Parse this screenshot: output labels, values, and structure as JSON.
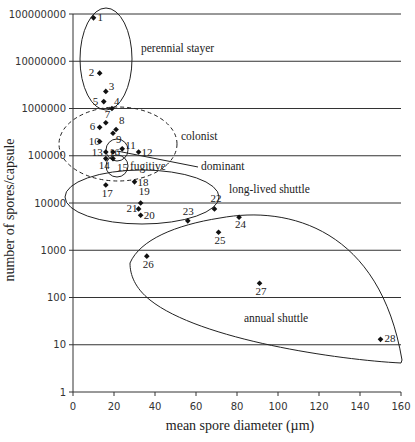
{
  "chart_data": {
    "type": "scatter",
    "title": "",
    "xlabel": "mean spore diameter (µm)",
    "ylabel": "number of spores/capsule",
    "xlim": [
      0,
      160
    ],
    "ylim": [
      1,
      100000000
    ],
    "yscale": "log",
    "grid": "horizontal",
    "x_ticks": [
      "0",
      "20",
      "40",
      "60",
      "80",
      "100",
      "120",
      "140",
      "160"
    ],
    "y_ticks": [
      "1",
      "10",
      "100",
      "1000",
      "10000",
      "100000",
      "1000000",
      "10000000",
      "100000000"
    ],
    "points": [
      {
        "id": "1",
        "x": 10,
        "y": 83000000
      },
      {
        "id": "2",
        "x": 13,
        "y": 5600000
      },
      {
        "id": "3",
        "x": 16,
        "y": 2300000
      },
      {
        "id": "4",
        "x": 19,
        "y": 1000000
      },
      {
        "id": "5",
        "x": 15,
        "y": 1400000
      },
      {
        "id": "6",
        "x": 13,
        "y": 400000
      },
      {
        "id": "7",
        "x": 16,
        "y": 500000
      },
      {
        "id": "8",
        "x": 21,
        "y": 360000
      },
      {
        "id": "9",
        "x": 19.5,
        "y": 300000
      },
      {
        "id": "10",
        "x": 13,
        "y": 200000
      },
      {
        "id": "11",
        "x": 24,
        "y": 140000
      },
      {
        "id": "12",
        "x": 32,
        "y": 120000
      },
      {
        "id": "13",
        "x": 16,
        "y": 120000
      },
      {
        "id": "14",
        "x": 16,
        "y": 87000
      },
      {
        "id": "15",
        "x": 19.5,
        "y": 87000
      },
      {
        "id": "16",
        "x": 19.5,
        "y": 120000
      },
      {
        "id": "17",
        "x": 16,
        "y": 24000
      },
      {
        "id": "18",
        "x": 30,
        "y": 28000
      },
      {
        "id": "19",
        "x": 33,
        "y": 10000
      },
      {
        "id": "20",
        "x": 33,
        "y": 5500
      },
      {
        "id": "21",
        "x": 32,
        "y": 7500
      },
      {
        "id": "22",
        "x": 69,
        "y": 7500
      },
      {
        "id": "23",
        "x": 56,
        "y": 4200
      },
      {
        "id": "24",
        "x": 81,
        "y": 5000
      },
      {
        "id": "25",
        "x": 71,
        "y": 2400
      },
      {
        "id": "26",
        "x": 36,
        "y": 750
      },
      {
        "id": "27",
        "x": 91,
        "y": 200
      },
      {
        "id": "28",
        "x": 150,
        "y": 13
      }
    ],
    "annotations": [
      "perennial stayer",
      "colonist",
      "fugitive",
      "dominant",
      "long-lived shuttle",
      "annual shuttle"
    ]
  },
  "labels": {
    "xlabel": "mean spore diameter (µm)",
    "ylabel": "number of spores/capsule",
    "perennial": "perennial stayer",
    "colonist": "colonist",
    "fugitive": "fugitive",
    "dominant": "dominant",
    "longlived": "long-lived shuttle",
    "annual": "annual shuttle"
  }
}
